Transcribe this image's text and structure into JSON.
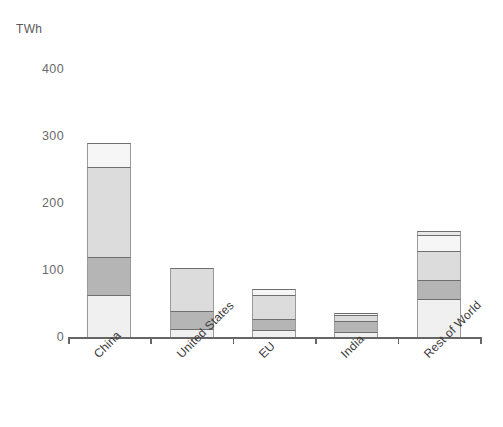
{
  "chart_data": {
    "type": "bar",
    "title": "",
    "subtitle": "",
    "xlabel": "",
    "ylabel": "TWh",
    "unit_label": "TWh",
    "stacked": true,
    "grid": false,
    "legend": "none",
    "ylim": [
      0,
      430
    ],
    "yticks": [
      0,
      100,
      200,
      300,
      400
    ],
    "ytick_labels": [
      "0",
      "100",
      "200",
      "300",
      "400"
    ],
    "categories": [
      "China",
      "United States",
      "EU",
      "India",
      "Rest of World"
    ],
    "series": [
      {
        "name": "segment-1",
        "color": "#f0f0f0",
        "values": [
          63,
          12,
          10,
          8,
          57
        ]
      },
      {
        "name": "segment-2",
        "color": "#b5b5b5",
        "values": [
          57,
          27,
          17,
          16,
          28
        ]
      },
      {
        "name": "segment-3",
        "color": "#dcdcdc",
        "values": [
          134,
          64,
          36,
          9,
          43
        ]
      },
      {
        "name": "segment-4",
        "color": "#f6f6f6",
        "values": [
          36,
          0,
          9,
          3,
          24
        ]
      },
      {
        "name": "segment-5",
        "color": "#e8e8e8",
        "values": [
          0,
          0,
          0,
          0,
          6
        ]
      }
    ],
    "totals": [
      290,
      103,
      72,
      36,
      158
    ],
    "bar_colors": {
      "seg1": "#f0f0f0",
      "seg2": "#b5b5b5",
      "seg3": "#dcdcdc",
      "seg4": "#f6f6f6",
      "seg5": "#e8e8e8"
    },
    "axis_color": "#666666",
    "tick_text_color": "#6a6a6a",
    "label_text_color": "#3a3a3a"
  }
}
